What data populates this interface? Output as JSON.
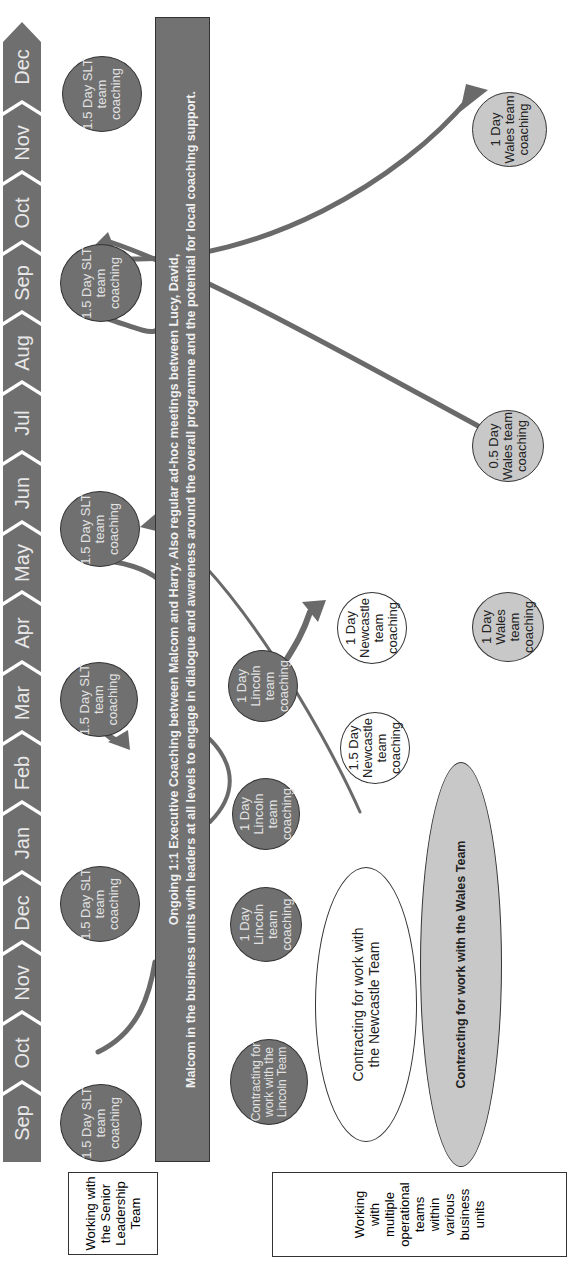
{
  "timeline": {
    "months": [
      "Sep",
      "Oct",
      "Nov",
      "Dec",
      "Jan",
      "Feb",
      "Mar",
      "Apr",
      "May",
      "Jun",
      "Jul",
      "Aug",
      "Sep",
      "Oct",
      "Nov",
      "Dec"
    ]
  },
  "row_labels": {
    "slt": "Working with the Senior Leadership Team",
    "operational": "Working with multiple operational teams within various business units"
  },
  "banner": {
    "line1": "Ongoing 1:1 Executive Coaching between Malcom and Harry. Also regular ad-hoc meetings between Lucy, David,",
    "line2": "Malcom in the business units with leaders at all levels to engage in dialogue and awareness around the overall programme and the potential for local coaching support."
  },
  "slt_sessions": [
    {
      "label": "1.5 Day SLT team coaching",
      "month": "Sep"
    },
    {
      "label": "1.5 Day SLT team coaching",
      "month": "Dec"
    },
    {
      "label": "1.5 Day SLT team coaching",
      "month": "Mar"
    },
    {
      "label": "1.5 Day SLT team coaching",
      "month": "May"
    },
    {
      "label": "1.5 Day SLT team coaching",
      "month": "Sep"
    },
    {
      "label": "1.5 Day SLT team coaching",
      "month": "Dec"
    }
  ],
  "lincoln": [
    {
      "label": "Contracting for work with the Lincoln Team"
    },
    {
      "label": "1 Day Lincoln team coaching"
    },
    {
      "label": "1 Day Lincoln team coaching"
    },
    {
      "label": "1 Day Lincoln team coaching"
    }
  ],
  "newcastle": [
    {
      "label": "Contracting for work with the Newcastle Team"
    },
    {
      "label": "1.5 Day Newcastle team coaching"
    },
    {
      "label": "1 Day Newcastle team coaching"
    }
  ],
  "wales": [
    {
      "label": "Contracting for work with the Wales Team"
    },
    {
      "label": "1 Day Wales team coaching"
    },
    {
      "label": "0.5 Day Wales team coaching"
    },
    {
      "label": "1 Day Wales team coaching"
    }
  ],
  "colors": {
    "dark_fill": "#707070",
    "light_fill": "#c8c8c8",
    "arrow": "#6a6a6a"
  }
}
